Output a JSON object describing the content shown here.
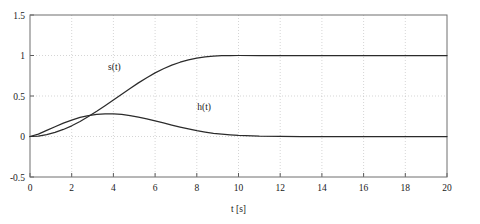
{
  "chart_data": {
    "type": "line",
    "title": "",
    "xlabel": "t [s]",
    "ylabel": "",
    "xlim": [
      0,
      20
    ],
    "ylim": [
      -0.5,
      1.5
    ],
    "xticks": [
      0,
      2,
      4,
      6,
      8,
      10,
      12,
      14,
      16,
      18,
      20
    ],
    "xtick_labels": [
      "0",
      "2",
      "4",
      "6",
      "8",
      "10",
      "12",
      "14",
      "16",
      "18",
      "20"
    ],
    "yticks": [
      -0.5,
      0,
      0.5,
      1,
      1.5
    ],
    "ytick_labels": [
      "-0.5",
      "0",
      "0.5",
      "1",
      "1.5"
    ],
    "grid": true,
    "legend": "none",
    "annotations": [
      {
        "text": "s(t)",
        "x": 4.05,
        "y": 0.82
      },
      {
        "text": "h(t)",
        "x": 8.35,
        "y": 0.33
      }
    ],
    "series": [
      {
        "name": "s(t)",
        "color": "#2b2b2b",
        "x": [
          0.0,
          0.4,
          0.8,
          1.2,
          1.6,
          2.0,
          2.4,
          2.8,
          3.2,
          3.6,
          4.0,
          4.4,
          4.8,
          5.2,
          5.6,
          6.0,
          6.4,
          6.8,
          7.2,
          7.6,
          8.0,
          8.4,
          8.8,
          9.2,
          9.6,
          10.0,
          11.0,
          12.0,
          13.0,
          14.0,
          15.0,
          16.0,
          17.0,
          18.0,
          19.0,
          20.0
        ],
        "y": [
          0.0,
          0.006,
          0.023,
          0.05,
          0.087,
          0.132,
          0.186,
          0.246,
          0.311,
          0.38,
          0.451,
          0.523,
          0.594,
          0.662,
          0.726,
          0.785,
          0.837,
          0.881,
          0.917,
          0.946,
          0.968,
          0.983,
          0.992,
          0.997,
          0.999,
          1.0,
          1.0,
          1.0,
          1.0,
          1.0,
          1.0,
          1.0,
          1.0,
          1.0,
          1.0,
          1.0
        ]
      },
      {
        "name": "h(t)",
        "color": "#2b2b2b",
        "x": [
          0.0,
          0.4,
          0.8,
          1.2,
          1.6,
          2.0,
          2.4,
          2.8,
          3.2,
          3.6,
          3.8,
          4.0,
          4.4,
          4.8,
          5.2,
          5.6,
          6.0,
          6.4,
          6.8,
          7.2,
          7.6,
          8.0,
          8.4,
          8.8,
          9.2,
          9.6,
          10.0,
          11.0,
          12.0,
          13.0,
          14.0,
          15.0,
          16.0,
          17.0,
          18.0,
          19.0,
          20.0
        ],
        "y": [
          0.0,
          0.03,
          0.075,
          0.12,
          0.165,
          0.203,
          0.235,
          0.258,
          0.272,
          0.279,
          0.28,
          0.279,
          0.272,
          0.259,
          0.24,
          0.218,
          0.193,
          0.167,
          0.141,
          0.116,
          0.093,
          0.072,
          0.055,
          0.04,
          0.029,
          0.02,
          0.013,
          0.004,
          0.001,
          0.0,
          0.0,
          0.0,
          0.0,
          0.0,
          0.0,
          0.0,
          0.0
        ]
      }
    ]
  }
}
